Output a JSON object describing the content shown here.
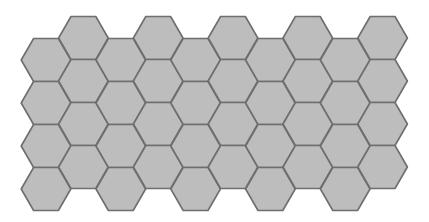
{
  "diagram": {
    "type": "hexagonal-grid",
    "orientation": "flat-top",
    "columns": 10,
    "rows_per_column": 4,
    "hex_radius": 24.8,
    "origin_x": 46,
    "origin_y_even": 60,
    "origin_y_odd": 38,
    "col_spacing": 37.4,
    "row_spacing": 43,
    "colors": {
      "fill": "#bdbdbd",
      "stroke": "#6e6e6e",
      "background": "#ffffff"
    }
  }
}
